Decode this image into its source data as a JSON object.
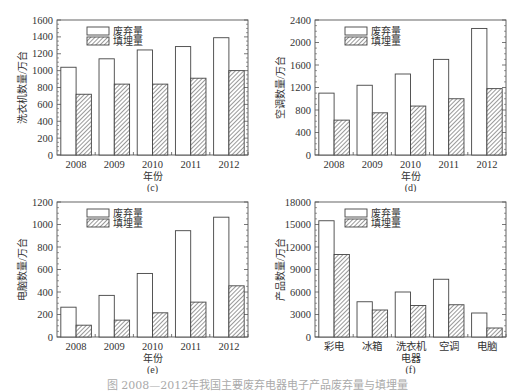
{
  "legend": {
    "discarded": "废弃量",
    "landfilled": "填埋量"
  },
  "caption": "图 2008—2012年我国主要废弃电器电子产品废弃量与填埋量",
  "chart_data": [
    {
      "id": "c",
      "type": "bar",
      "panel_label": "(c)",
      "title": "",
      "xlabel": "年份",
      "ylabel": "洗衣机数量/万台",
      "categories": [
        "2008",
        "2009",
        "2010",
        "2011",
        "2012"
      ],
      "series": [
        {
          "name": "废弃量",
          "values": [
            1040,
            1140,
            1245,
            1285,
            1390
          ],
          "fill": "white"
        },
        {
          "name": "填埋量",
          "values": [
            720,
            840,
            840,
            910,
            1000
          ],
          "fill": "hatched"
        }
      ],
      "ylim": [
        0,
        1600
      ],
      "yticks": [
        0,
        200,
        400,
        600,
        800,
        1000,
        1200,
        1400,
        1600
      ],
      "grid": false,
      "legend_position": "upper-left"
    },
    {
      "id": "d",
      "type": "bar",
      "panel_label": "(d)",
      "title": "",
      "xlabel": "年份",
      "ylabel": "空调数量/万台",
      "categories": [
        "2008",
        "2009",
        "2010",
        "2011",
        "2012"
      ],
      "series": [
        {
          "name": "废弃量",
          "values": [
            1100,
            1240,
            1440,
            1700,
            2250
          ],
          "fill": "white"
        },
        {
          "name": "填埋量",
          "values": [
            620,
            750,
            870,
            1000,
            1180
          ],
          "fill": "hatched"
        }
      ],
      "ylim": [
        0,
        2400
      ],
      "yticks": [
        0,
        400,
        800,
        1200,
        1600,
        2000,
        2400
      ],
      "grid": false,
      "legend_position": "upper-left"
    },
    {
      "id": "e",
      "type": "bar",
      "panel_label": "(e)",
      "title": "",
      "xlabel": "年份",
      "ylabel": "电脑数量/万台",
      "categories": [
        "2008",
        "2009",
        "2010",
        "2011",
        "2012"
      ],
      "series": [
        {
          "name": "废弃量",
          "values": [
            265,
            370,
            565,
            945,
            1065
          ],
          "fill": "white"
        },
        {
          "name": "填埋量",
          "values": [
            105,
            150,
            215,
            310,
            455
          ],
          "fill": "hatched"
        }
      ],
      "ylim": [
        0,
        1200
      ],
      "yticks": [
        0,
        200,
        400,
        600,
        800,
        1000,
        1200
      ],
      "grid": false,
      "legend_position": "upper-left"
    },
    {
      "id": "f",
      "type": "bar",
      "panel_label": "(f)",
      "title": "",
      "xlabel": "电器",
      "ylabel": "产品数量/万台",
      "categories": [
        "彩电",
        "冰箱",
        "洗衣机",
        "空调",
        "电脑"
      ],
      "series": [
        {
          "name": "废弃量",
          "values": [
            15500,
            4700,
            6000,
            7700,
            3200
          ],
          "fill": "white"
        },
        {
          "name": "填埋量",
          "values": [
            11000,
            3600,
            4200,
            4300,
            1200
          ],
          "fill": "hatched"
        }
      ],
      "ylim": [
        0,
        18000
      ],
      "yticks": [
        0,
        3000,
        6000,
        9000,
        12000,
        15000,
        18000
      ],
      "grid": false,
      "legend_position": "upper-left"
    }
  ]
}
